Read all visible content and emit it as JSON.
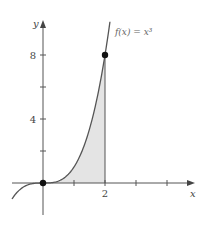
{
  "chart_data": {
    "type": "line",
    "title": "",
    "function_label": "f(x) = x³",
    "xlabel": "x",
    "ylabel": "y",
    "xlim": [
      -1.0,
      4.9
    ],
    "ylim": [
      -1.0,
      10.2
    ],
    "x_ticks": [
      1,
      2,
      3,
      4
    ],
    "x_tick_labels": [
      {
        "value": 2,
        "label": "2"
      }
    ],
    "y_ticks": [
      2,
      4,
      6,
      8
    ],
    "y_tick_labels": [
      {
        "value": 4,
        "label": "4"
      },
      {
        "value": 8,
        "label": "8"
      }
    ],
    "grid": false,
    "series": [
      {
        "name": "f(x) = x³",
        "expression": "x^3",
        "x_range": [
          -1.0,
          2.16
        ]
      }
    ],
    "shaded_region": {
      "from_x": 0,
      "to_x": 2,
      "under": "f(x) = x³",
      "color": "#e4e4e4"
    },
    "points": [
      {
        "x": 0,
        "y": 0
      },
      {
        "x": 2,
        "y": 8
      }
    ],
    "vertical_line": {
      "x": 2,
      "from_y": 0,
      "to_y": 8
    }
  },
  "layout": {
    "origin_px": [
      43,
      183
    ],
    "px_per_x": 31,
    "px_per_y": 16
  }
}
